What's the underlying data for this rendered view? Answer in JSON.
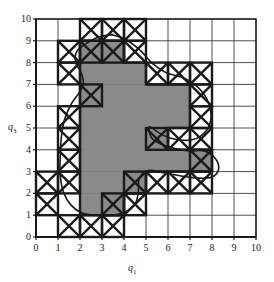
{
  "figure": {
    "xlabel": "q1",
    "ylabel": "q3",
    "xlabel_base": "q",
    "xlabel_sub": "1",
    "ylabel_base": "q",
    "ylabel_sub": "3"
  },
  "colors": {
    "fill_gray": "#8a8a8a",
    "line_black": "#1a1a1a",
    "grid_thin": "#3a3a3a",
    "background": "#ffffff"
  },
  "chart_data": {
    "type": "heatmap",
    "title": "",
    "xlabel": "q1",
    "ylabel": "q3",
    "xlim": [
      0,
      10
    ],
    "ylim": [
      0,
      10
    ],
    "grid": true,
    "legend": null,
    "x_ticks": [
      "0",
      "1",
      "2",
      "3",
      "4",
      "5",
      "6",
      "7",
      "8",
      "9",
      "10"
    ],
    "y_ticks": [
      "0",
      "1",
      "2",
      "3",
      "4",
      "5",
      "6",
      "7",
      "8",
      "9",
      "10"
    ],
    "cell_size": 1,
    "categories": [
      "interior",
      "boundary",
      "exterior"
    ],
    "interior_cells": [
      [
        2,
        8
      ],
      [
        3,
        8
      ],
      [
        2,
        7
      ],
      [
        3,
        7
      ],
      [
        4,
        7
      ],
      [
        2,
        6
      ],
      [
        3,
        6
      ],
      [
        4,
        6
      ],
      [
        5,
        6
      ],
      [
        6,
        6
      ],
      [
        2,
        5
      ],
      [
        3,
        5
      ],
      [
        4,
        5
      ],
      [
        5,
        5
      ],
      [
        6,
        5
      ],
      [
        2,
        4
      ],
      [
        3,
        4
      ],
      [
        4,
        4
      ],
      [
        5,
        4
      ],
      [
        2,
        3
      ],
      [
        3,
        3
      ],
      [
        4,
        3
      ],
      [
        5,
        3
      ],
      [
        6,
        3
      ],
      [
        7,
        3
      ],
      [
        2,
        2
      ],
      [
        3,
        2
      ],
      [
        4,
        2
      ],
      [
        2,
        1
      ],
      [
        3,
        1
      ]
    ],
    "boundary_cells": [
      [
        2,
        9
      ],
      [
        3,
        9
      ],
      [
        4,
        9
      ],
      [
        1,
        8
      ],
      [
        2,
        8
      ],
      [
        3,
        8
      ],
      [
        4,
        8
      ],
      [
        1,
        7
      ],
      [
        5,
        7
      ],
      [
        6,
        7
      ],
      [
        7,
        7
      ],
      [
        2,
        6
      ],
      [
        7,
        6
      ],
      [
        1,
        5
      ],
      [
        7,
        5
      ],
      [
        1,
        4
      ],
      [
        5,
        4
      ],
      [
        6,
        4
      ],
      [
        7,
        4
      ],
      [
        1,
        3
      ],
      [
        7,
        3
      ],
      [
        0,
        2
      ],
      [
        1,
        2
      ],
      [
        4,
        2
      ],
      [
        5,
        2
      ],
      [
        6,
        2
      ],
      [
        7,
        2
      ],
      [
        0,
        1
      ],
      [
        3,
        1
      ],
      [
        4,
        1
      ],
      [
        1,
        0
      ],
      [
        2,
        0
      ],
      [
        3,
        0
      ]
    ],
    "curve_points": [
      [
        3.45,
        9.28
      ],
      [
        4.1,
        9.05
      ],
      [
        4.75,
        8.55
      ],
      [
        5.3,
        7.95
      ],
      [
        5.9,
        7.55
      ],
      [
        6.55,
        7.35
      ],
      [
        7.15,
        7.05
      ],
      [
        7.7,
        6.45
      ],
      [
        7.95,
        5.7
      ],
      [
        7.85,
        5.05
      ],
      [
        7.45,
        4.6
      ],
      [
        7.05,
        4.45
      ],
      [
        6.55,
        4.45
      ],
      [
        6.05,
        4.55
      ],
      [
        5.55,
        4.8
      ],
      [
        5.15,
        5.05
      ],
      [
        5.25,
        4.55
      ],
      [
        5.7,
        4.25
      ],
      [
        6.35,
        4.05
      ],
      [
        7.0,
        3.95
      ],
      [
        7.65,
        3.95
      ],
      [
        8.15,
        3.6
      ],
      [
        8.3,
        3.1
      ],
      [
        8.0,
        2.75
      ],
      [
        7.4,
        2.7
      ],
      [
        6.6,
        2.8
      ],
      [
        5.8,
        2.95
      ],
      [
        5.1,
        3.05
      ],
      [
        4.7,
        2.7
      ],
      [
        4.65,
        2.05
      ],
      [
        4.5,
        1.5
      ],
      [
        4.05,
        1.15
      ],
      [
        3.4,
        1.0
      ],
      [
        2.7,
        1.0
      ],
      [
        2.1,
        1.1
      ],
      [
        1.6,
        1.45
      ],
      [
        1.25,
        2.05
      ],
      [
        1.1,
        2.85
      ],
      [
        1.1,
        3.7
      ],
      [
        1.15,
        4.55
      ],
      [
        1.3,
        5.4
      ],
      [
        1.6,
        6.1
      ],
      [
        1.95,
        6.6
      ],
      [
        2.15,
        7.05
      ],
      [
        2.05,
        7.55
      ],
      [
        1.8,
        8.0
      ],
      [
        1.85,
        8.5
      ],
      [
        2.25,
        8.85
      ],
      [
        2.8,
        9.15
      ],
      [
        3.45,
        9.28
      ]
    ]
  }
}
